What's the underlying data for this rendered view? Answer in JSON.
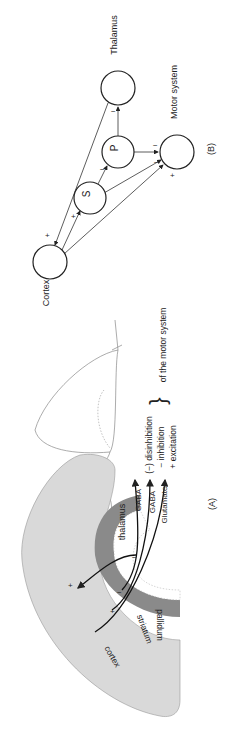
{
  "panel_b": {
    "label": "(B)",
    "nodes": {
      "cortex": "Cortex",
      "thalamus": "Thalamus",
      "motor": "Motor system",
      "s": "S",
      "p": "P"
    },
    "signs": {
      "cortex_in": "+",
      "c_to_s": "+",
      "s_to_p": "−",
      "p_to_thal": "−",
      "p_to_motor": "−",
      "s_to_motor": "−",
      "c_to_motor": "+"
    }
  },
  "panel_a": {
    "label": "(A)",
    "regions": {
      "cortex": "cortex",
      "striatum": "striatum",
      "pallidum": "pallidum",
      "thalamus": "thalamus"
    },
    "pathways": [
      "GABA",
      "GABA",
      "Glutamate"
    ],
    "legend": [
      "(−) disinhibition",
      "− inhibition",
      "+ excitation"
    ],
    "legend_suffix": "of the motor system",
    "signs": {
      "plus_cortex": "+",
      "minus_thal": "−",
      "plus_str": "+",
      "minus_pal": "−"
    }
  }
}
